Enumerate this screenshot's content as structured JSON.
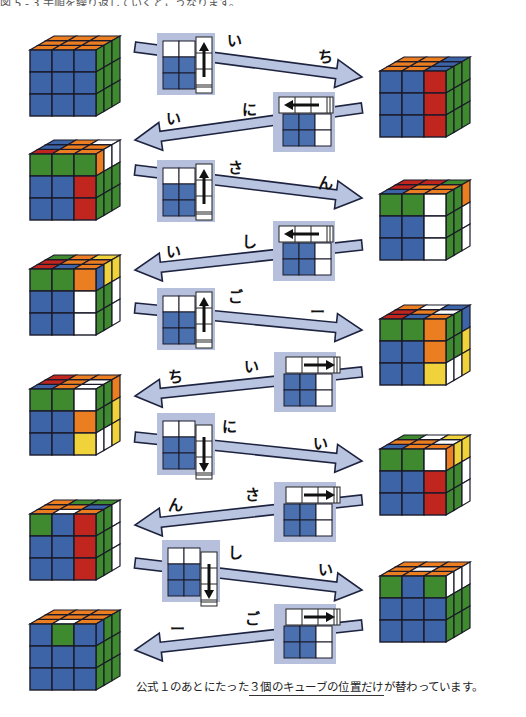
{
  "header": {
    "cut_text": "図 5 - 3 手順を繰り返していくとこうなります。"
  },
  "colors": {
    "B": "#3d64a6",
    "G": "#3f8a2e",
    "R": "#c0261e",
    "O": "#ec7e22",
    "W": "#ffffff",
    "Y": "#f0d23a",
    "arrow_fill": "#b9c5e0",
    "move_box": "#b6c0dd",
    "move_blue": "#4a70b0"
  },
  "cubes": [
    {
      "id": "L1",
      "x": 30,
      "y": 36,
      "front": [
        "B",
        "B",
        "B",
        "B",
        "B",
        "B",
        "B",
        "B",
        "B"
      ],
      "side": [
        "G",
        "G",
        "G",
        "G",
        "G",
        "G",
        "G",
        "G",
        "G"
      ],
      "top": [
        "O",
        "O",
        "O",
        "O",
        "O",
        "O",
        "O",
        "O",
        "O"
      ]
    },
    {
      "id": "R1",
      "x": 380,
      "y": 57,
      "front": [
        "B",
        "B",
        "R",
        "B",
        "B",
        "R",
        "B",
        "B",
        "R"
      ],
      "side": [
        "G",
        "G",
        "G",
        "G",
        "G",
        "G",
        "G",
        "G",
        "G"
      ],
      "top": [
        "O",
        "O",
        "B",
        "O",
        "O",
        "B",
        "O",
        "O",
        "B"
      ]
    },
    {
      "id": "L2",
      "x": 30,
      "y": 140,
      "front": [
        "G",
        "G",
        "G",
        "B",
        "B",
        "R",
        "B",
        "B",
        "R"
      ],
      "side": [
        "O",
        "W",
        "W",
        "G",
        "G",
        "G",
        "G",
        "G",
        "G"
      ],
      "top": [
        "R",
        "O",
        "O",
        "B",
        "O",
        "O",
        "B",
        "O",
        "W"
      ]
    },
    {
      "id": "R2",
      "x": 380,
      "y": 180,
      "front": [
        "G",
        "G",
        "W",
        "B",
        "B",
        "W",
        "B",
        "B",
        "W"
      ],
      "side": [
        "G",
        "G",
        "O",
        "G",
        "G",
        "W",
        "G",
        "G",
        "W"
      ],
      "top": [
        "B",
        "O",
        "O",
        "R",
        "O",
        "O",
        "R",
        "R",
        "G"
      ]
    },
    {
      "id": "L3",
      "x": 30,
      "y": 255,
      "front": [
        "G",
        "G",
        "O",
        "B",
        "B",
        "W",
        "B",
        "B",
        "W"
      ],
      "side": [
        "B",
        "Y",
        "Y",
        "G",
        "G",
        "W",
        "G",
        "G",
        "W"
      ],
      "top": [
        "R",
        "B",
        "O",
        "R",
        "O",
        "O",
        "G",
        "O",
        "Y"
      ]
    },
    {
      "id": "R3",
      "x": 380,
      "y": 305,
      "front": [
        "G",
        "G",
        "O",
        "B",
        "B",
        "O",
        "B",
        "B",
        "Y"
      ],
      "side": [
        "G",
        "G",
        "B",
        "G",
        "G",
        "Y",
        "W",
        "W",
        "Y"
      ],
      "top": [
        "R",
        "B",
        "O",
        "R",
        "O",
        "W",
        "O",
        "W",
        "B"
      ]
    },
    {
      "id": "L4",
      "x": 30,
      "y": 375,
      "front": [
        "G",
        "G",
        "W",
        "B",
        "B",
        "O",
        "B",
        "B",
        "Y"
      ],
      "side": [
        "G",
        "G",
        "O",
        "G",
        "G",
        "Y",
        "W",
        "W",
        "Y"
      ],
      "top": [
        "B",
        "O",
        "W",
        "R",
        "O",
        "W",
        "R",
        "O",
        "O"
      ]
    },
    {
      "id": "R4",
      "x": 380,
      "y": 435,
      "front": [
        "G",
        "G",
        "W",
        "B",
        "B",
        "R",
        "B",
        "B",
        "R"
      ],
      "side": [
        "O",
        "Y",
        "Y",
        "G",
        "G",
        "W",
        "G",
        "G",
        "W"
      ],
      "top": [
        "B",
        "O",
        "O",
        "O",
        "O",
        "W",
        "G",
        "W",
        "Y"
      ]
    },
    {
      "id": "L5",
      "x": 30,
      "y": 500,
      "front": [
        "G",
        "B",
        "R",
        "B",
        "B",
        "R",
        "B",
        "B",
        "R"
      ],
      "side": [
        "G",
        "G",
        "W",
        "G",
        "G",
        "W",
        "G",
        "G",
        "W"
      ],
      "top": [
        "O",
        "W",
        "O",
        "O",
        "O",
        "B",
        "O",
        "G",
        "G"
      ]
    },
    {
      "id": "R5",
      "x": 380,
      "y": 562,
      "front": [
        "G",
        "B",
        "G",
        "B",
        "B",
        "B",
        "B",
        "B",
        "B"
      ],
      "side": [
        "W",
        "W",
        "W",
        "G",
        "G",
        "G",
        "G",
        "G",
        "G"
      ],
      "top": [
        "O",
        "O",
        "O",
        "O",
        "W",
        "O",
        "O",
        "O",
        "O"
      ]
    },
    {
      "id": "L6",
      "x": 30,
      "y": 610,
      "front": [
        "B",
        "G",
        "B",
        "B",
        "B",
        "B",
        "B",
        "B",
        "B"
      ],
      "side": [
        "B",
        "G",
        "G",
        "G",
        "G",
        "G",
        "G",
        "G",
        "G"
      ],
      "top": [
        "O",
        "W",
        "O",
        "O",
        "O",
        "O",
        "O",
        "O",
        "O"
      ]
    }
  ],
  "arrows": [
    {
      "dir": "right",
      "from": [
        135,
        47
      ],
      "to": [
        362,
        77
      ],
      "syllables": [
        "い",
        "ち"
      ],
      "syl_pos": [
        [
          227,
          34
        ],
        [
          318,
          50
        ]
      ],
      "move": {
        "type": "up",
        "x": 157,
        "y": 33
      }
    },
    {
      "dir": "left",
      "from": [
        362,
        108
      ],
      "to": [
        135,
        140
      ],
      "syllables": [
        "い",
        "に"
      ],
      "syl_pos": [
        [
          166,
          112
        ],
        [
          242,
          103
        ]
      ],
      "move": {
        "type": "left",
        "x": 273,
        "y": 92
      }
    },
    {
      "dir": "right",
      "from": [
        135,
        170
      ],
      "to": [
        362,
        198
      ],
      "syllables": [
        "さ",
        "ん"
      ],
      "syl_pos": [
        [
          228,
          161
        ],
        [
          318,
          176
        ]
      ],
      "move": {
        "type": "up",
        "x": 157,
        "y": 160
      }
    },
    {
      "dir": "left",
      "from": [
        362,
        245
      ],
      "to": [
        135,
        270
      ],
      "syllables": [
        "い",
        "し"
      ],
      "syl_pos": [
        [
          166,
          245
        ],
        [
          242,
          235
        ]
      ],
      "move": {
        "type": "left",
        "x": 273,
        "y": 221
      }
    },
    {
      "dir": "right",
      "from": [
        135,
        308
      ],
      "to": [
        362,
        330
      ],
      "syllables": [
        "ご",
        "ー"
      ],
      "syl_pos": [
        [
          228,
          290
        ],
        [
          310,
          305
        ]
      ],
      "move": {
        "type": "up",
        "x": 157,
        "y": 288
      }
    },
    {
      "dir": "left",
      "from": [
        362,
        372
      ],
      "to": [
        135,
        396
      ],
      "syllables": [
        "ち",
        "い"
      ],
      "syl_pos": [
        [
          168,
          370
        ],
        [
          244,
          360
        ]
      ],
      "move": {
        "type": "right",
        "x": 274,
        "y": 352
      }
    },
    {
      "dir": "right",
      "from": [
        135,
        437
      ],
      "to": [
        362,
        461
      ],
      "syllables": [
        "に",
        "い"
      ],
      "syl_pos": [
        [
          222,
          420
        ],
        [
          313,
          437
        ]
      ],
      "move": {
        "type": "down",
        "x": 157,
        "y": 413
      }
    },
    {
      "dir": "left",
      "from": [
        362,
        500
      ],
      "to": [
        135,
        525
      ],
      "syllables": [
        "ん",
        "さ"
      ],
      "syl_pos": [
        [
          168,
          498
        ],
        [
          245,
          488
        ]
      ],
      "move": {
        "type": "right",
        "x": 274,
        "y": 482
      }
    },
    {
      "dir": "right",
      "from": [
        135,
        563
      ],
      "to": [
        362,
        590
      ],
      "syllables": [
        "し",
        "い"
      ],
      "syl_pos": [
        [
          228,
          546
        ],
        [
          318,
          563
        ]
      ],
      "move": {
        "type": "down",
        "x": 162,
        "y": 540
      }
    },
    {
      "dir": "left",
      "from": [
        362,
        625
      ],
      "to": [
        135,
        650
      ],
      "syllables": [
        "ー",
        "ご"
      ],
      "syl_pos": [
        [
          170,
          622
        ],
        [
          245,
          612
        ]
      ],
      "move": {
        "type": "right",
        "x": 274,
        "y": 604
      }
    }
  ],
  "caption": {
    "before": "公式１のあとにたった",
    "underlined": "３個のキューブの位置だけ",
    "after": "が替わっています。"
  }
}
